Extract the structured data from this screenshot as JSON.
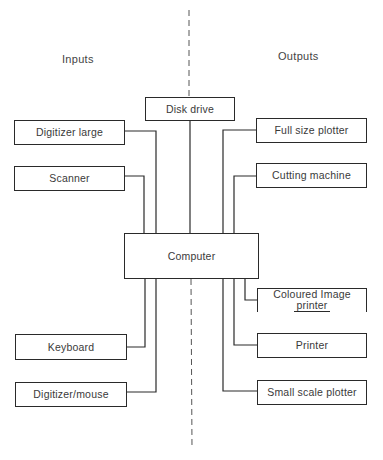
{
  "headings": {
    "inputs": "Inputs",
    "outputs": "Outputs"
  },
  "center": {
    "disk_drive": "Disk drive",
    "computer": "Computer"
  },
  "inputs": [
    {
      "label": "Digitizer large"
    },
    {
      "label": "Scanner"
    },
    {
      "label": "Keyboard"
    },
    {
      "label": "Digitizer/mouse"
    }
  ],
  "outputs": [
    {
      "label": "Full size plotter"
    },
    {
      "label": "Cutting machine"
    },
    {
      "label_line1": "Coloured Image",
      "label_line2": "printer"
    },
    {
      "label": "Printer"
    },
    {
      "label": "Small scale plotter"
    }
  ],
  "colors": {
    "line": "#2a2a2a",
    "text": "#3a3a3a",
    "background": "#ffffff"
  }
}
